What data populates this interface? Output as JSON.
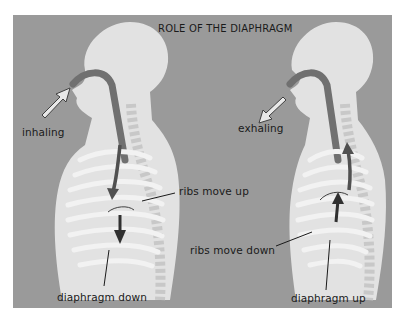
{
  "diagram": {
    "title": "ROLE OF THE DIAPHRAGM",
    "colors": {
      "background": "#9a9a9a",
      "body": "#e4e4e4",
      "airway": "#6e6e6e",
      "ribs": "#d8d8d8",
      "arrow_dark": "#404040",
      "text": "#1a1a1a"
    },
    "left_figure": {
      "state": "inhaling",
      "labels": {
        "breath": "inhaling",
        "ribs": "ribs move up",
        "diaphragm": "diaphragm down"
      }
    },
    "right_figure": {
      "state": "exhaling",
      "labels": {
        "breath": "exhaling",
        "ribs": "ribs move down",
        "diaphragm": "diaphragm up"
      }
    }
  }
}
